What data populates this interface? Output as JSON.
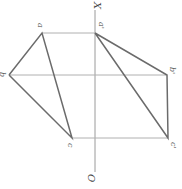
{
  "diagram": {
    "type": "orthographic-projection",
    "rotation_deg": 90,
    "axis": {
      "start_label": "X",
      "end_label": "O"
    },
    "colors": {
      "edge": "#6b6b6b",
      "projector": "#b0b0b0",
      "axis": "#9a9a9a",
      "label": "#555555"
    },
    "points_plan": [
      {
        "id": "a",
        "label": "a",
        "x": 42,
        "y": 33
      },
      {
        "id": "b",
        "label": "b",
        "x": 9,
        "y": 75
      },
      {
        "id": "c",
        "label": "c",
        "x": 72,
        "y": 138
      }
    ],
    "points_elevation": [
      {
        "id": "a1",
        "label": "a'",
        "x": 95,
        "y": 33
      },
      {
        "id": "b1",
        "label": "b'",
        "x": 167,
        "y": 75
      },
      {
        "id": "c1",
        "label": "c'",
        "x": 168,
        "y": 138
      }
    ]
  }
}
